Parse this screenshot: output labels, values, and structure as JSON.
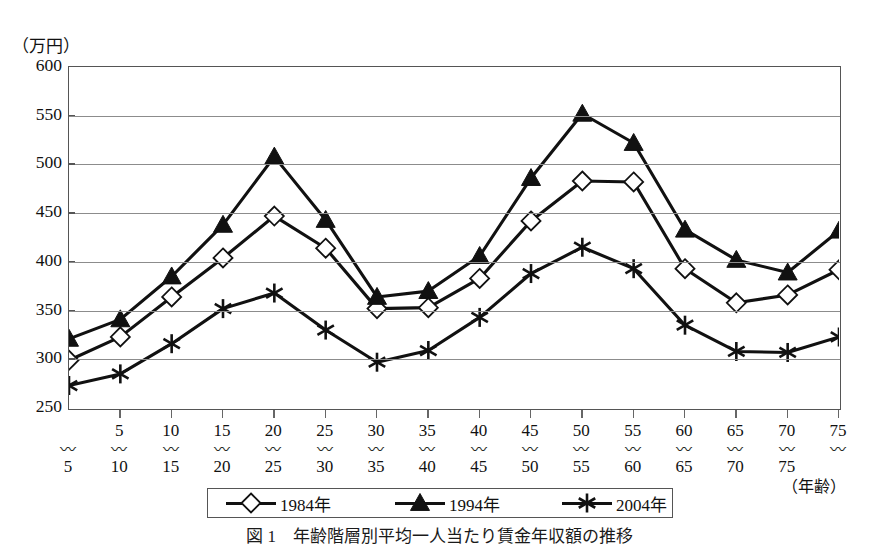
{
  "figure": {
    "y_unit_label": "（万円）",
    "x_unit_label": "（年齢）",
    "caption": "図 1　年齢階層別平均一人当たり賃金年収額の推移"
  },
  "legend": {
    "position": "bottom-center",
    "items": [
      {
        "label": "1984年",
        "marker": "diamond-open-marker",
        "color": "#111111"
      },
      {
        "label": "1994年",
        "marker": "triangle-filled-marker",
        "color": "#111111"
      },
      {
        "label": "2004年",
        "marker": "asterisk-marker",
        "color": "#111111"
      }
    ]
  },
  "chart_data": {
    "type": "line",
    "title": "",
    "xlabel": "（年齢）",
    "ylabel": "（万円）",
    "ylim": [
      250,
      600
    ],
    "yticks": [
      250,
      300,
      350,
      400,
      450,
      500,
      550,
      600
    ],
    "grid": true,
    "categories": [
      "〜5",
      "5〜10",
      "10〜15",
      "15〜20",
      "20〜25",
      "25〜30",
      "30〜35",
      "35〜40",
      "40〜45",
      "45〜50",
      "50〜55",
      "55〜60",
      "60〜65",
      "65〜70",
      "70〜75",
      "75〜"
    ],
    "category_bounds": [
      {
        "lo": "",
        "hi": "5"
      },
      {
        "lo": "5",
        "hi": "10"
      },
      {
        "lo": "10",
        "hi": "15"
      },
      {
        "lo": "15",
        "hi": "20"
      },
      {
        "lo": "20",
        "hi": "25"
      },
      {
        "lo": "25",
        "hi": "30"
      },
      {
        "lo": "30",
        "hi": "35"
      },
      {
        "lo": "35",
        "hi": "40"
      },
      {
        "lo": "40",
        "hi": "45"
      },
      {
        "lo": "45",
        "hi": "50"
      },
      {
        "lo": "50",
        "hi": "55"
      },
      {
        "lo": "55",
        "hi": "60"
      },
      {
        "lo": "60",
        "hi": "65"
      },
      {
        "lo": "65",
        "hi": "70"
      },
      {
        "lo": "70",
        "hi": "75"
      },
      {
        "lo": "75",
        "hi": ""
      }
    ],
    "series": [
      {
        "name": "1984年",
        "marker": "diamond-open-marker",
        "color": "#111111",
        "values": [
          299,
          323,
          364,
          404,
          447,
          414,
          352,
          353,
          383,
          442,
          483,
          482,
          393,
          358,
          366,
          392
        ]
      },
      {
        "name": "1994年",
        "marker": "triangle-filled-marker",
        "color": "#111111",
        "values": [
          321,
          341,
          385,
          438,
          508,
          443,
          364,
          370,
          406,
          486,
          552,
          522,
          433,
          402,
          389,
          432
        ]
      },
      {
        "name": "2004年",
        "marker": "asterisk-marker",
        "color": "#111111",
        "values": [
          273,
          285,
          316,
          352,
          368,
          330,
          297,
          309,
          343,
          388,
          415,
          393,
          335,
          308,
          307,
          323
        ]
      }
    ]
  }
}
